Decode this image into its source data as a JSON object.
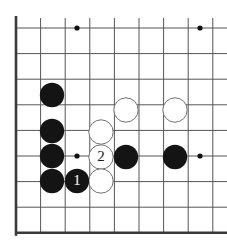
{
  "diagram": {
    "board": {
      "type": "go-goban-corner",
      "size_px": [
        227,
        240
      ],
      "origin_px": [
        16,
        28
      ],
      "cell_w": 24.6,
      "cell_h": 25.6,
      "cols": 9,
      "rows": 8,
      "line_color": "#555555",
      "edge_color": "#3a3a3a",
      "background": "#ffffff",
      "edges": [
        "left",
        "bottom"
      ],
      "star_points": [
        {
          "col": 2.5,
          "row": 0,
          "x": 77,
          "y": 28
        },
        {
          "col": 7.5,
          "row": 0,
          "x": 200,
          "y": 28
        },
        {
          "col": 2.5,
          "row": 5,
          "x": 77,
          "y": 156
        },
        {
          "col": 7.5,
          "row": 5,
          "x": 200,
          "y": 156
        }
      ]
    },
    "stones": [
      {
        "id": "b1",
        "color": "black",
        "x": 52,
        "y": 95,
        "label": ""
      },
      {
        "id": "b2",
        "color": "black",
        "x": 52,
        "y": 131,
        "label": ""
      },
      {
        "id": "b3",
        "color": "black",
        "x": 52,
        "y": 156,
        "label": ""
      },
      {
        "id": "b4",
        "color": "black",
        "x": 52,
        "y": 181,
        "label": ""
      },
      {
        "id": "w1",
        "color": "white",
        "x": 126,
        "y": 110,
        "label": ""
      },
      {
        "id": "w2",
        "color": "white",
        "x": 175,
        "y": 110,
        "label": ""
      },
      {
        "id": "w3",
        "color": "white",
        "x": 101,
        "y": 132,
        "label": ""
      },
      {
        "id": "w4",
        "color": "white",
        "x": 101,
        "y": 157,
        "label": "2"
      },
      {
        "id": "b5",
        "color": "black",
        "x": 126,
        "y": 157,
        "label": ""
      },
      {
        "id": "b6",
        "color": "black",
        "x": 175,
        "y": 157,
        "label": ""
      },
      {
        "id": "w5",
        "color": "white",
        "x": 101,
        "y": 181,
        "label": ""
      },
      {
        "id": "b7",
        "color": "black",
        "x": 77,
        "y": 181,
        "label": "1"
      }
    ],
    "move_numbers": [
      {
        "number": "1",
        "color": "black",
        "x": 77,
        "y": 181
      },
      {
        "number": "2",
        "color": "white",
        "x": 101,
        "y": 157
      }
    ],
    "colors": {
      "black_stone": "#141414",
      "white_stone": "#ffffff",
      "white_stone_outline": "#707070",
      "grid": "#555555",
      "board_edge": "#3a3a3a",
      "star_point": "#111111",
      "black_label_text": "#ffffff",
      "white_label_text": "#1a1a1a"
    },
    "stone_radius": 12.2
  }
}
